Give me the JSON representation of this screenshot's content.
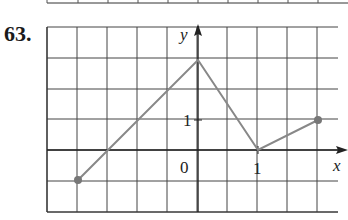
{
  "problem": {
    "number": "63."
  },
  "chart_data": {
    "type": "line",
    "title": "",
    "xlabel": "x",
    "ylabel": "y",
    "x_tick_labels": [
      "0",
      "1"
    ],
    "y_tick_labels": [
      "1"
    ],
    "grid": true,
    "x_range": [
      -2.5,
      2.5
    ],
    "y_range": [
      -2,
      4
    ],
    "x_unit_px": 60,
    "y_unit_px": 30,
    "series": [
      {
        "name": "piecewise-linear",
        "color": "#888888",
        "points": [
          [
            -2,
            -1
          ],
          [
            0,
            3
          ],
          [
            1,
            0
          ],
          [
            2,
            1
          ]
        ],
        "closed_endpoints": [
          [
            -2,
            -1
          ],
          [
            2,
            1
          ]
        ]
      }
    ]
  }
}
